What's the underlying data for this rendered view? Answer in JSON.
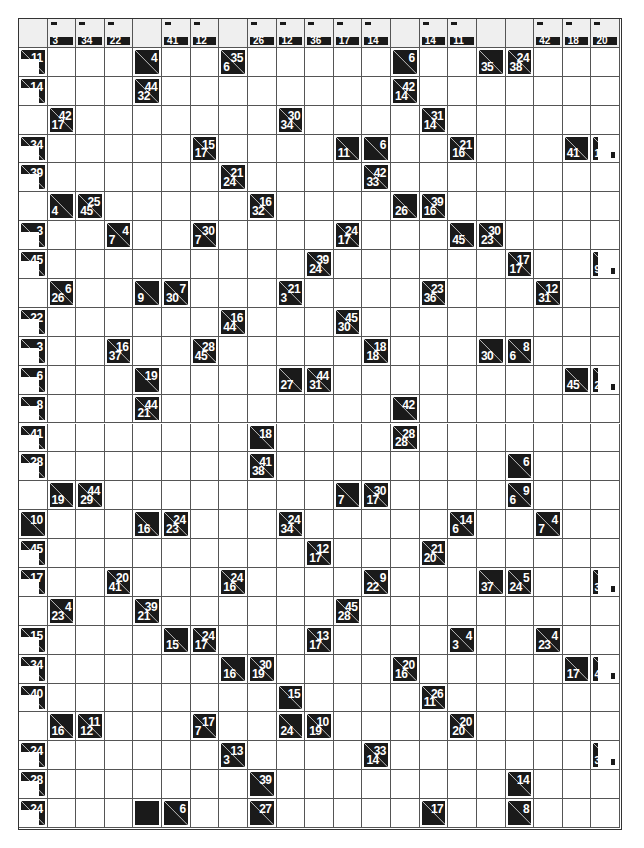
{
  "puzzle": {
    "type": "kakuro",
    "rows": 28,
    "cols": 21,
    "colors": {
      "clue_bg": "#1a1a1a",
      "clue_text": "#ffffff",
      "header_bg": "#efefef",
      "grid_line": "#555555"
    },
    "header": [
      {
        "c": 1,
        "down": "3"
      },
      {
        "c": 2,
        "down": "34"
      },
      {
        "c": 3,
        "down": "22"
      },
      {
        "c": 5,
        "down": "41"
      },
      {
        "c": 6,
        "down": "12"
      },
      {
        "c": 8,
        "down": "26"
      },
      {
        "c": 9,
        "down": "12"
      },
      {
        "c": 10,
        "down": "36"
      },
      {
        "c": 11,
        "down": "17"
      },
      {
        "c": 12,
        "down": "14"
      },
      {
        "c": 14,
        "down": "14"
      },
      {
        "c": 15,
        "down": "11"
      },
      {
        "c": 18,
        "down": "42"
      },
      {
        "c": 19,
        "down": "18"
      },
      {
        "c": 20,
        "down": "20"
      }
    ],
    "left_clues": [
      {
        "r": 1,
        "across": "11",
        "kind": "partial"
      },
      {
        "r": 2,
        "across": "14",
        "kind": "partial"
      },
      {
        "r": 4,
        "across": "34",
        "kind": "partial"
      },
      {
        "r": 5,
        "across": "39",
        "kind": "partial"
      },
      {
        "r": 7,
        "across": "3",
        "kind": "partial"
      },
      {
        "r": 8,
        "across": "45",
        "kind": "partial"
      },
      {
        "r": 10,
        "across": "22",
        "kind": "partial"
      },
      {
        "r": 11,
        "across": "3",
        "kind": "partial"
      },
      {
        "r": 12,
        "across": "6",
        "kind": "partial"
      },
      {
        "r": 13,
        "across": "8",
        "kind": "partial"
      },
      {
        "r": 14,
        "across": "41",
        "kind": "partial"
      },
      {
        "r": 15,
        "across": "28",
        "kind": "partial"
      },
      {
        "r": 17,
        "across": "10",
        "kind": "full"
      },
      {
        "r": 18,
        "across": "45",
        "kind": "partial"
      },
      {
        "r": 19,
        "across": "17",
        "kind": "partial"
      },
      {
        "r": 21,
        "across": "15",
        "kind": "partial"
      },
      {
        "r": 22,
        "across": "34",
        "kind": "partial"
      },
      {
        "r": 23,
        "across": "40",
        "kind": "partial"
      },
      {
        "r": 25,
        "across": "24",
        "kind": "partial"
      },
      {
        "r": 26,
        "across": "28",
        "kind": "partial"
      },
      {
        "r": 27,
        "across": "24",
        "kind": "partial"
      }
    ],
    "right_partial_clues": [
      {
        "r": 4,
        "text": "19"
      },
      {
        "r": 8,
        "text": "9"
      },
      {
        "r": 12,
        "text": "2"
      },
      {
        "r": 19,
        "text": "3"
      },
      {
        "r": 22,
        "text": "4"
      },
      {
        "r": 25,
        "text": "3"
      }
    ],
    "clues": [
      {
        "r": 1,
        "c": 4,
        "across": "4",
        "down": ""
      },
      {
        "r": 1,
        "c": 7,
        "across": "35",
        "down": "6"
      },
      {
        "r": 1,
        "c": 13,
        "across": "6",
        "down": ""
      },
      {
        "r": 1,
        "c": 16,
        "across": "",
        "down": "35"
      },
      {
        "r": 1,
        "c": 17,
        "across": "24",
        "down": "38"
      },
      {
        "r": 2,
        "c": 4,
        "across": "44",
        "down": "32"
      },
      {
        "r": 2,
        "c": 13,
        "across": "42",
        "down": "14"
      },
      {
        "r": 3,
        "c": 1,
        "across": "42",
        "down": "17"
      },
      {
        "r": 3,
        "c": 9,
        "across": "30",
        "down": "34"
      },
      {
        "r": 3,
        "c": 14,
        "across": "31",
        "down": "14"
      },
      {
        "r": 4,
        "c": 6,
        "across": "15",
        "down": "17"
      },
      {
        "r": 4,
        "c": 11,
        "across": "",
        "down": "11"
      },
      {
        "r": 4,
        "c": 12,
        "across": "6",
        "down": ""
      },
      {
        "r": 4,
        "c": 15,
        "across": "21",
        "down": "16"
      },
      {
        "r": 4,
        "c": 19,
        "across": "",
        "down": "41"
      },
      {
        "r": 5,
        "c": 7,
        "across": "21",
        "down": "24"
      },
      {
        "r": 5,
        "c": 12,
        "across": "42",
        "down": "33"
      },
      {
        "r": 6,
        "c": 1,
        "across": "",
        "down": "4"
      },
      {
        "r": 6,
        "c": 2,
        "across": "25",
        "down": "45"
      },
      {
        "r": 6,
        "c": 8,
        "across": "16",
        "down": "32"
      },
      {
        "r": 6,
        "c": 13,
        "across": "",
        "down": "26"
      },
      {
        "r": 6,
        "c": 14,
        "across": "39",
        "down": "16"
      },
      {
        "r": 7,
        "c": 3,
        "across": "4",
        "down": "7"
      },
      {
        "r": 7,
        "c": 6,
        "across": "30",
        "down": "7"
      },
      {
        "r": 7,
        "c": 11,
        "across": "24",
        "down": "17"
      },
      {
        "r": 7,
        "c": 15,
        "across": "",
        "down": "45"
      },
      {
        "r": 7,
        "c": 16,
        "across": "30",
        "down": "23"
      },
      {
        "r": 8,
        "c": 10,
        "across": "39",
        "down": "24"
      },
      {
        "r": 8,
        "c": 17,
        "across": "17",
        "down": "17"
      },
      {
        "r": 9,
        "c": 1,
        "across": "6",
        "down": "26"
      },
      {
        "r": 9,
        "c": 4,
        "across": "",
        "down": "9"
      },
      {
        "r": 9,
        "c": 5,
        "across": "7",
        "down": "30"
      },
      {
        "r": 9,
        "c": 9,
        "across": "21",
        "down": "3"
      },
      {
        "r": 9,
        "c": 14,
        "across": "23",
        "down": "36"
      },
      {
        "r": 9,
        "c": 18,
        "across": "12",
        "down": "31"
      },
      {
        "r": 10,
        "c": 7,
        "across": "16",
        "down": "44"
      },
      {
        "r": 10,
        "c": 11,
        "across": "45",
        "down": "30"
      },
      {
        "r": 11,
        "c": 3,
        "across": "16",
        "down": "37"
      },
      {
        "r": 11,
        "c": 6,
        "across": "28",
        "down": "45"
      },
      {
        "r": 11,
        "c": 12,
        "across": "18",
        "down": "18"
      },
      {
        "r": 11,
        "c": 16,
        "across": "",
        "down": "30"
      },
      {
        "r": 11,
        "c": 17,
        "across": "8",
        "down": "6"
      },
      {
        "r": 12,
        "c": 4,
        "across": "19",
        "down": ""
      },
      {
        "r": 12,
        "c": 9,
        "across": "",
        "down": "27"
      },
      {
        "r": 12,
        "c": 10,
        "across": "44",
        "down": "31"
      },
      {
        "r": 12,
        "c": 19,
        "across": "",
        "down": "45"
      },
      {
        "r": 13,
        "c": 4,
        "across": "44",
        "down": "21"
      },
      {
        "r": 13,
        "c": 13,
        "across": "42",
        "down": ""
      },
      {
        "r": 14,
        "c": 8,
        "across": "18",
        "down": ""
      },
      {
        "r": 14,
        "c": 13,
        "across": "28",
        "down": "28"
      },
      {
        "r": 15,
        "c": 8,
        "across": "41",
        "down": "38"
      },
      {
        "r": 15,
        "c": 17,
        "across": "6",
        "down": ""
      },
      {
        "r": 16,
        "c": 1,
        "across": "",
        "down": "19"
      },
      {
        "r": 16,
        "c": 2,
        "across": "44",
        "down": "29"
      },
      {
        "r": 16,
        "c": 11,
        "across": "",
        "down": "7"
      },
      {
        "r": 16,
        "c": 12,
        "across": "30",
        "down": "17"
      },
      {
        "r": 16,
        "c": 17,
        "across": "9",
        "down": "6"
      },
      {
        "r": 17,
        "c": 4,
        "across": "",
        "down": "16"
      },
      {
        "r": 17,
        "c": 5,
        "across": "24",
        "down": "23"
      },
      {
        "r": 17,
        "c": 9,
        "across": "24",
        "down": "34"
      },
      {
        "r": 17,
        "c": 15,
        "across": "14",
        "down": "6"
      },
      {
        "r": 17,
        "c": 18,
        "across": "4",
        "down": "7"
      },
      {
        "r": 18,
        "c": 10,
        "across": "12",
        "down": "17"
      },
      {
        "r": 18,
        "c": 14,
        "across": "21",
        "down": "20"
      },
      {
        "r": 19,
        "c": 3,
        "across": "20",
        "down": "41"
      },
      {
        "r": 19,
        "c": 7,
        "across": "24",
        "down": "16"
      },
      {
        "r": 19,
        "c": 12,
        "across": "9",
        "down": "22"
      },
      {
        "r": 19,
        "c": 16,
        "across": "",
        "down": "37"
      },
      {
        "r": 19,
        "c": 17,
        "across": "5",
        "down": "24"
      },
      {
        "r": 20,
        "c": 1,
        "across": "4",
        "down": "23"
      },
      {
        "r": 20,
        "c": 4,
        "across": "39",
        "down": "21"
      },
      {
        "r": 20,
        "c": 11,
        "across": "45",
        "down": "28"
      },
      {
        "r": 21,
        "c": 5,
        "across": "",
        "down": "15"
      },
      {
        "r": 21,
        "c": 6,
        "across": "24",
        "down": "17"
      },
      {
        "r": 21,
        "c": 10,
        "across": "13",
        "down": "17"
      },
      {
        "r": 21,
        "c": 15,
        "across": "4",
        "down": "3"
      },
      {
        "r": 21,
        "c": 18,
        "across": "4",
        "down": "23"
      },
      {
        "r": 22,
        "c": 7,
        "across": "",
        "down": "16"
      },
      {
        "r": 22,
        "c": 8,
        "across": "30",
        "down": "19"
      },
      {
        "r": 22,
        "c": 13,
        "across": "20",
        "down": "16"
      },
      {
        "r": 22,
        "c": 19,
        "across": "",
        "down": "17"
      },
      {
        "r": 23,
        "c": 9,
        "across": "15",
        "down": ""
      },
      {
        "r": 23,
        "c": 14,
        "across": "26",
        "down": "11"
      },
      {
        "r": 24,
        "c": 1,
        "across": "",
        "down": "16"
      },
      {
        "r": 24,
        "c": 2,
        "across": "11",
        "down": "12"
      },
      {
        "r": 24,
        "c": 6,
        "across": "17",
        "down": "7"
      },
      {
        "r": 24,
        "c": 9,
        "across": "",
        "down": "24"
      },
      {
        "r": 24,
        "c": 10,
        "across": "10",
        "down": "19"
      },
      {
        "r": 24,
        "c": 15,
        "across": "20",
        "down": "20"
      },
      {
        "r": 25,
        "c": 7,
        "across": "13",
        "down": "3"
      },
      {
        "r": 25,
        "c": 12,
        "across": "33",
        "down": "14"
      },
      {
        "r": 26,
        "c": 8,
        "across": "39",
        "down": ""
      },
      {
        "r": 26,
        "c": 17,
        "across": "14",
        "down": ""
      },
      {
        "r": 27,
        "c": 5,
        "across": "6",
        "down": ""
      },
      {
        "r": 27,
        "c": 8,
        "across": "27",
        "down": ""
      },
      {
        "r": 27,
        "c": 14,
        "across": "17",
        "down": ""
      },
      {
        "r": 27,
        "c": 17,
        "across": "8",
        "down": ""
      }
    ],
    "blocks": [
      {
        "r": 27,
        "c": 4
      }
    ]
  }
}
